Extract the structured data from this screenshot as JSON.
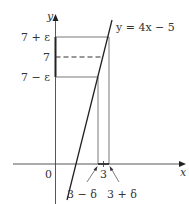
{
  "diagram": {
    "axes": {
      "x_label": "x",
      "y_label": "y",
      "origin_label": "0"
    },
    "line": {
      "equation": "y = 4x − 5",
      "slope": 4,
      "intercept": -5
    },
    "y_ticks": {
      "upper": "7 + ε",
      "center": "7",
      "lower": "7 − ε"
    },
    "x_ticks": {
      "center": "3",
      "left": "3 − δ",
      "right": "3 + δ"
    },
    "colors": {
      "axis": "#333333",
      "guide": "#555555",
      "line": "#222222"
    }
  }
}
